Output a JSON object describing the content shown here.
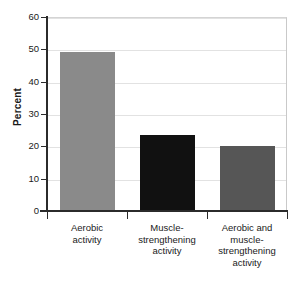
{
  "chart_data": {
    "type": "bar",
    "title": "",
    "subtitle": "",
    "xlabel": "",
    "ylabel": "Percent",
    "ylim": [
      0,
      60
    ],
    "yticks": [
      0,
      10,
      20,
      30,
      40,
      50,
      60
    ],
    "grid": true,
    "legend": null,
    "categories": [
      "Aerobic activity",
      "Muscle-strengthening activity",
      "Aerobic and muscle-strengthening activity"
    ],
    "category_lines": [
      [
        "Aerobic",
        "activity"
      ],
      [
        "Muscle-",
        "strengthening",
        "activity"
      ],
      [
        "Aerobic and",
        "muscle-",
        "strengthening",
        "activity"
      ]
    ],
    "values": [
      49.2,
      23.6,
      20.0
    ],
    "bar_colors": [
      "#8a8a8a",
      "#111111",
      "#565656"
    ]
  },
  "axis": {
    "y_title": "Percent",
    "tick_labels": [
      "60",
      "50",
      "40",
      "30",
      "20",
      "10",
      "0"
    ]
  },
  "style": {
    "axis_color": "#2b2b2b",
    "grid_color": "#e2e2e2",
    "frame_color": "#c9c9c9",
    "text_color": "#1a1a1a",
    "background": "#ffffff"
  }
}
